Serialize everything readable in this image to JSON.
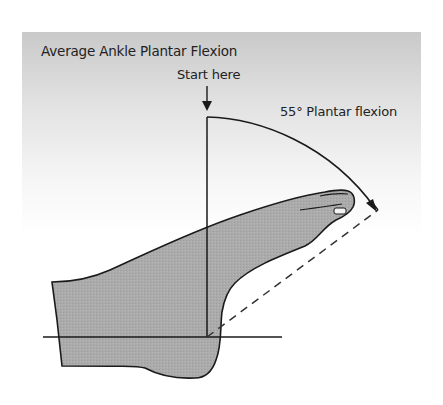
{
  "figure": {
    "title": "Average Ankle Plantar Flexion",
    "start_label": "Start here",
    "angle_label": "55° Plantar flexion",
    "angle_degrees": 55,
    "colors": {
      "foot_fill": "#a9a9a9",
      "outline": "#1a1a1a",
      "panel_top": "#c9c9c9",
      "background": "#ffffff"
    },
    "icons": {
      "start_arrow": "down-arrow-icon",
      "arc_arrow": "arc-arrow-icon"
    }
  }
}
